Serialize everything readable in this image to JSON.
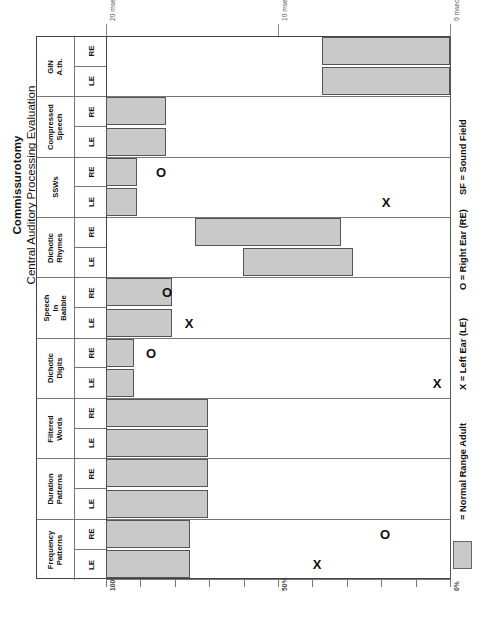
{
  "title": {
    "main": "Commissurotomy",
    "sub": "Central Auditory Processing Evaluation"
  },
  "legend": {
    "normal_range": "= Normal Range Adult",
    "x_key": "X = Left Ear (LE)",
    "o_key": "O = Right Ear (RE)",
    "sf_key": "SF = Sound Field",
    "swatch_color": "#c9c9c9"
  },
  "ear_labels": {
    "re": "RE",
    "le": "LE"
  },
  "axes": {
    "top": {
      "label_unit": "msec",
      "ticks": [
        {
          "label": "20 msec",
          "value": 20
        },
        {
          "label": "10 msec",
          "value": 10
        },
        {
          "label": "0 msec",
          "value": 0
        }
      ]
    },
    "bottom": {
      "label_unit": "%",
      "ticks": [
        {
          "label": "100%",
          "value": 100
        },
        {
          "label": "",
          "value": 90
        },
        {
          "label": "",
          "value": 80
        },
        {
          "label": "",
          "value": 70
        },
        {
          "label": "",
          "value": 60
        },
        {
          "label": "50%",
          "value": 50
        },
        {
          "label": "",
          "value": 40
        },
        {
          "label": "",
          "value": 30
        },
        {
          "label": "",
          "value": 20
        },
        {
          "label": "",
          "value": 10
        },
        {
          "label": "0%",
          "value": 0
        }
      ]
    }
  },
  "chart_data": {
    "type": "bar",
    "title": "Central Auditory Processing Evaluation",
    "subtitle": "Commissurotomy",
    "xlabel": "",
    "ylabel": "",
    "grid": false,
    "orientation": "horizontal",
    "xlim_percent": [
      0,
      100
    ],
    "xlim_msec": [
      0,
      20
    ],
    "legend_position": "right",
    "note": "Shaded bars = Normal Range Adult. X = Left Ear (LE) score, O = Right Ear (RE) score.",
    "categories": [
      "GIN A.th.",
      "Compressed Speech",
      "SSWs",
      "Dichotic Rhymes",
      "Speech In Babble",
      "Dichotic Digits",
      "Filtered Words",
      "Duration Patterns",
      "Frequency Patterns"
    ],
    "rows": [
      {
        "name": "GIN A.th.",
        "label": "GIN\nA.th.",
        "scale": "msec",
        "normal_range_re": [
          0,
          7.5
        ],
        "normal_range_le": [
          0,
          7.5
        ],
        "score_re": null,
        "score_le": null
      },
      {
        "name": "Compressed Speech",
        "label": "Compressed\nSpeech",
        "scale": "percent",
        "normal_range_re": [
          83,
          100
        ],
        "normal_range_le": [
          83,
          100
        ],
        "score_re": null,
        "score_le": null
      },
      {
        "name": "SSWs",
        "label": "SSWs",
        "scale": "percent",
        "normal_range_re": [
          91,
          100
        ],
        "normal_range_le": [
          91,
          100
        ],
        "score_re": null,
        "score_le": 19
      },
      {
        "name": "Dichotic Rhymes",
        "label": "Dichotic\nRhymes",
        "scale": "percent",
        "normal_range_re": [
          32,
          74
        ],
        "normal_range_le": [
          28,
          60
        ],
        "score_re": null,
        "score_le": null
      },
      {
        "name": "Speech In Babble",
        "label": "Speech\nIn\nBabble",
        "scale": "percent",
        "normal_range_re": [
          38,
          100
        ],
        "normal_range_le": [
          38,
          100
        ],
        "score_re": 72,
        "score_le": 55
      },
      {
        "name": "Dichotic Digits",
        "label": "Dichotic\nDigits",
        "scale": "percent",
        "normal_range_re": [
          92,
          100
        ],
        "normal_range_le": [
          92,
          100
        ],
        "score_re": 87,
        "score_le": 4
      },
      {
        "name": "Filtered Words",
        "label": "Filtered\nWords",
        "scale": "percent",
        "normal_range_re": [
          70,
          100
        ],
        "normal_range_le": [
          70,
          100
        ],
        "score_re": null,
        "score_le": null
      },
      {
        "name": "Duration Patterns",
        "label": "Duration\nPatterns",
        "scale": "percent",
        "normal_range_re": [
          70,
          100
        ],
        "normal_range_le": [
          70,
          100
        ],
        "score_re": null,
        "score_le": null
      },
      {
        "name": "Frequency Patterns",
        "label": "Frequency\nPatterns",
        "scale": "percent",
        "normal_range_re": [
          76,
          100
        ],
        "normal_range_le": [
          76,
          100
        ],
        "score_re": 19,
        "score_le": 39
      }
    ]
  },
  "geometry": {
    "plot_left": 106,
    "plot_right": 450,
    "plot_top": 36,
    "plot_bottom": 579,
    "bars": [
      {
        "row": 0,
        "sub": "re",
        "x": 322,
        "w": 128
      },
      {
        "row": 0,
        "sub": "le",
        "x": 322,
        "w": 128
      },
      {
        "row": 1,
        "sub": "re",
        "x": 106,
        "w": 60
      },
      {
        "row": 1,
        "sub": "le",
        "x": 106,
        "w": 60
      },
      {
        "row": 2,
        "sub": "re",
        "x": 106,
        "w": 31
      },
      {
        "row": 2,
        "sub": "le",
        "x": 106,
        "w": 31
      },
      {
        "row": 3,
        "sub": "re",
        "x": 195,
        "w": 146
      },
      {
        "row": 3,
        "sub": "le",
        "x": 243,
        "w": 110
      },
      {
        "row": 4,
        "sub": "re",
        "x": 106,
        "w": 66
      },
      {
        "row": 4,
        "sub": "le",
        "x": 106,
        "w": 66
      },
      {
        "row": 5,
        "sub": "re",
        "x": 106,
        "w": 28
      },
      {
        "row": 5,
        "sub": "le",
        "x": 106,
        "w": 28
      },
      {
        "row": 6,
        "sub": "re",
        "x": 106,
        "w": 102
      },
      {
        "row": 6,
        "sub": "le",
        "x": 106,
        "w": 102
      },
      {
        "row": 7,
        "sub": "re",
        "x": 106,
        "w": 102
      },
      {
        "row": 7,
        "sub": "le",
        "x": 106,
        "w": 102
      },
      {
        "row": 8,
        "sub": "re",
        "x": 106,
        "w": 84
      },
      {
        "row": 8,
        "sub": "le",
        "x": 106,
        "w": 84
      }
    ],
    "markers": [
      {
        "row": 2,
        "sub": "re",
        "x": 161,
        "glyph": "O"
      },
      {
        "row": 2,
        "sub": "le",
        "x": 386,
        "glyph": "X"
      },
      {
        "row": 4,
        "sub": "re",
        "x": 167,
        "glyph": "O"
      },
      {
        "row": 4,
        "sub": "le",
        "x": 189,
        "glyph": "X"
      },
      {
        "row": 5,
        "sub": "re",
        "x": 151,
        "glyph": "O"
      },
      {
        "row": 5,
        "sub": "le",
        "x": 437,
        "glyph": "X"
      },
      {
        "row": 8,
        "sub": "re",
        "x": 385,
        "glyph": "O"
      },
      {
        "row": 8,
        "sub": "le",
        "x": 317,
        "glyph": "X"
      }
    ]
  }
}
